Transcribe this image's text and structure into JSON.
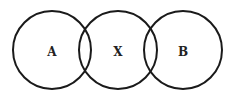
{
  "diagram": {
    "type": "venn-chain",
    "stroke_color": "#1a1a1a",
    "background": "#ffffff",
    "circles": [
      {
        "label": "A",
        "cx": 52,
        "cy": 50,
        "r": 39
      },
      {
        "label": "X",
        "cx": 118,
        "cy": 50,
        "r": 39
      },
      {
        "label": "B",
        "cx": 183,
        "cy": 50,
        "r": 39
      }
    ]
  }
}
